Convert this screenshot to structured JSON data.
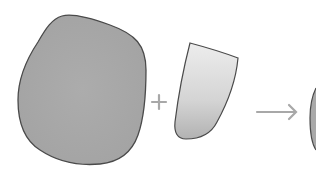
{
  "diagram": {
    "operator_plus": "+",
    "operator_arrow": "→",
    "colors": {
      "background": "#ffffff",
      "large_shape_fill": "#a9a9a9",
      "outline": "#4a4a4a",
      "small_shape_top": "#ececec",
      "small_shape_bottom": "#b4b4b4",
      "operator": "#a8a8a8"
    }
  }
}
